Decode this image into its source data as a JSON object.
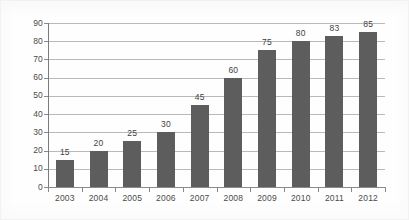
{
  "chart_data": {
    "type": "bar",
    "title": "",
    "subtitle": "",
    "xlabel": "",
    "ylabel": "",
    "categories": [
      "2003",
      "2004",
      "2005",
      "2006",
      "2007",
      "2008",
      "2009",
      "2010",
      "2011",
      "2012"
    ],
    "values": [
      15,
      20,
      25,
      30,
      45,
      60,
      75,
      80,
      83,
      85
    ],
    "data_labels": [
      "15",
      "20",
      "25",
      "30",
      "45",
      "60",
      "75",
      "80",
      "83",
      "85"
    ],
    "ylim": [
      0,
      90
    ],
    "ytick_values": [
      0,
      10,
      20,
      30,
      40,
      50,
      60,
      70,
      80,
      90
    ],
    "ytick_labels": [
      "0",
      "10",
      "20",
      "30",
      "40",
      "50",
      "60",
      "70",
      "80",
      "90"
    ],
    "grid": "horizontal",
    "legend": "none",
    "series": [
      {
        "name": "",
        "values": [
          15,
          20,
          25,
          30,
          45,
          60,
          75,
          80,
          83,
          85
        ]
      }
    ],
    "colors": {
      "bar_fill": "#5d5d5d",
      "gridline": "#b9b9b9",
      "axis": "#8a8a8a",
      "tick_text": "#4a4a4a",
      "data_label_text": "#3f3f3f",
      "background": "#fefefe"
    }
  }
}
